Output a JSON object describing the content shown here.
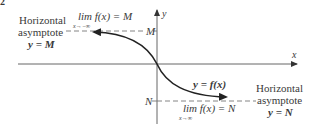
{
  "figure": {
    "number_label": "2",
    "axes": {
      "x_label": "x",
      "y_label": "y"
    },
    "upper": {
      "asymptote_label_line1": "Horizontal",
      "asymptote_label_line2": "asymptote",
      "asymptote_equation": "y = M",
      "limit_expr": "lim f(x) = M",
      "limit_sub": "x→−∞",
      "axis_mark": "M"
    },
    "lower": {
      "asymptote_label_line1": "Horizontal",
      "asymptote_label_line2": "asymptote",
      "asymptote_equation": "y = N",
      "limit_expr": "lim f(x) = N",
      "limit_sub": "x→∞",
      "axis_mark": "N"
    },
    "curve_label": "y = f(x)",
    "colors": {
      "axis": "#555555",
      "curve": "#222222",
      "dash": "#777777",
      "text": "#3a3a3a"
    }
  }
}
